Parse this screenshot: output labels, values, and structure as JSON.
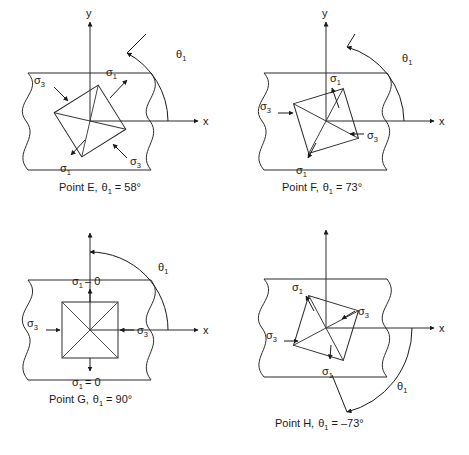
{
  "figure": {
    "type": "engineering-diagram",
    "axis_labels": {
      "x": "x",
      "y": "y"
    },
    "symbols": {
      "sigma1": "σ1",
      "sigma3": "σ3",
      "theta1": "θ1",
      "sigma1_base": "σ",
      "sigma1_sub": "1",
      "sigma3_sub": "3",
      "theta_base": "θ",
      "theta_sub": "1"
    }
  },
  "panels": [
    {
      "id": "E",
      "caption": "Point E, θ1 = 58°",
      "caption_point": "Point E,",
      "caption_theta": "θ",
      "caption_sub": "1",
      "caption_value": "= 58°",
      "theta_deg": 58,
      "theta_label": "θ1",
      "element_rotation_deg": 32,
      "element_shape": "rotated-square-with-diagonals",
      "labels": [
        {
          "name": "sigma1-upper-right",
          "text": "σ1"
        },
        {
          "name": "sigma3-upper-left",
          "text": "σ3"
        },
        {
          "name": "sigma1-lower-left",
          "text": "σ1"
        },
        {
          "name": "sigma3-lower-right",
          "text": "σ3"
        }
      ]
    },
    {
      "id": "F",
      "caption": "Point F, θ1 = 73°",
      "caption_point": "Point F,",
      "caption_theta": "θ",
      "caption_sub": "1",
      "caption_value": "= 73°",
      "theta_deg": 73,
      "theta_label": "θ1",
      "element_rotation_deg": 17,
      "element_shape": "rotated-square-with-diagonals",
      "labels": [
        {
          "name": "sigma1-upper",
          "text": "σ1"
        },
        {
          "name": "sigma3-left",
          "text": "σ3"
        },
        {
          "name": "sigma1-lower",
          "text": "σ1"
        },
        {
          "name": "sigma3-right",
          "text": "σ3"
        }
      ]
    },
    {
      "id": "G",
      "caption": "Point G, θ1 = 90°",
      "caption_point": "Point G,",
      "caption_theta": "θ",
      "caption_sub": "1",
      "caption_value": "= 90°",
      "theta_deg": 90,
      "theta_label": "θ1",
      "element_rotation_deg": 0,
      "element_shape": "axis-aligned-square-with-diagonals",
      "labels": [
        {
          "name": "sigma1-top-zero",
          "text": "σ1 – 0"
        },
        {
          "name": "sigma3-left",
          "text": "σ3"
        },
        {
          "name": "sigma3-right",
          "text": "σ3"
        },
        {
          "name": "sigma1-bottom-zero",
          "text": "σ1 = 0"
        }
      ],
      "sigma1_top_prefix": "σ",
      "sigma1_top_sub": "1",
      "sigma1_top_suffix": "– 0",
      "sigma1_bottom_prefix": "σ",
      "sigma1_bottom_sub": "1",
      "sigma1_bottom_suffix": "= 0"
    },
    {
      "id": "H",
      "caption": "Point H, θ1 = –73°",
      "caption_point": "Point H,",
      "caption_theta": "θ",
      "caption_sub": "1",
      "caption_value": "= –73°",
      "theta_deg": -73,
      "theta_label": "θ1",
      "element_rotation_deg": -17,
      "element_shape": "rotated-square-with-diagonals",
      "labels": [
        {
          "name": "sigma1-upper-left",
          "text": "σ1"
        },
        {
          "name": "sigma3-upper-right",
          "text": "σ3"
        },
        {
          "name": "sigma3-lower-left",
          "text": "σ3"
        },
        {
          "name": "sigma1-lower",
          "text": "σ1"
        }
      ]
    }
  ],
  "colors": {
    "stroke": "#2b2b2b",
    "text": "#1a1a1a",
    "background": "#ffffff"
  }
}
